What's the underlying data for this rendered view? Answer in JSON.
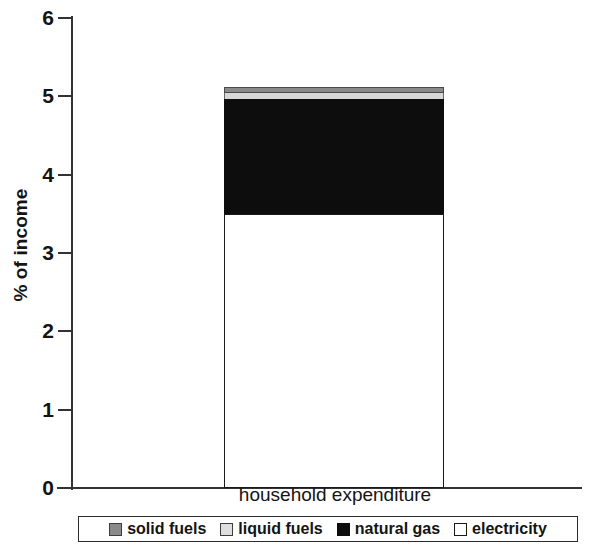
{
  "chart_data": {
    "type": "bar",
    "title": "",
    "subtitle": "",
    "xlabel": "",
    "ylabel": "% of income",
    "categories": [
      "household expenditure"
    ],
    "stacked": true,
    "grid": false,
    "legend_position": "bottom",
    "ylim": [
      0,
      6
    ],
    "yticks": [
      0,
      1,
      2,
      3,
      4,
      5,
      6
    ],
    "ytick_labels": [
      "0",
      "1",
      "2",
      "3",
      "4",
      "5",
      "6"
    ],
    "series": [
      {
        "name": "electricity",
        "values": [
          3.5
        ],
        "color": "#ffffff"
      },
      {
        "name": "natural gas",
        "values": [
          1.47
        ],
        "color": "#0d0d0d"
      },
      {
        "name": "liquid fuels",
        "values": [
          0.07
        ],
        "color": "#d8d8d8"
      },
      {
        "name": "solid fuels",
        "values": [
          0.08
        ],
        "color": "#8a8a8a"
      }
    ],
    "stack_total": [
      5.12
    ],
    "annotations": []
  },
  "axis": {
    "y_title": "% of income",
    "ticks": [
      {
        "label": "6",
        "value": 6
      },
      {
        "label": "5",
        "value": 5
      },
      {
        "label": "4",
        "value": 4
      },
      {
        "label": "3",
        "value": 3
      },
      {
        "label": "2",
        "value": 2
      },
      {
        "label": "1",
        "value": 1
      },
      {
        "label": "0",
        "value": 0
      }
    ]
  },
  "category": {
    "label": "household expenditure"
  },
  "legend": {
    "items": [
      {
        "label": "solid fuels",
        "swatch": "solid-fuels-swatch",
        "swatch_class": "sw-solid"
      },
      {
        "label": "liquid fuels",
        "swatch": "liquid-fuels-swatch",
        "swatch_class": "sw-liquid"
      },
      {
        "label": "natural gas",
        "swatch": "natural-gas-swatch",
        "swatch_class": "sw-gas"
      },
      {
        "label": "electricity",
        "swatch": "electricity-swatch",
        "swatch_class": "sw-elec"
      }
    ]
  }
}
